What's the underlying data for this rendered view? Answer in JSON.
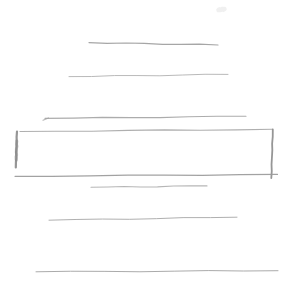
{
  "page": {
    "background": "#ffffff",
    "width": 296,
    "height": 286
  },
  "wireframe": {
    "text_lines": [
      {
        "name": "text-line-1",
        "x1": 89,
        "y1": 42.6,
        "x2": 218,
        "y2": 45,
        "color": "#9e9e9e",
        "width": 1.2
      },
      {
        "name": "text-line-2",
        "x1": 69,
        "y1": 76.6,
        "x2": 228,
        "y2": 74.4,
        "color": "#b3b3b3",
        "width": 1.0
      },
      {
        "name": "text-line-3",
        "x1": 45,
        "y1": 118.4,
        "x2": 246,
        "y2": 116.3,
        "color": "#a5a5a5",
        "width": 1.1,
        "tick": true
      },
      {
        "name": "text-line-4",
        "x1": 91,
        "y1": 187.3,
        "x2": 207,
        "y2": 185.9,
        "color": "#b0b0b0",
        "width": 1.1
      },
      {
        "name": "text-line-5",
        "x1": 49,
        "y1": 220.2,
        "x2": 237,
        "y2": 217.2,
        "color": "#a8a8a8",
        "width": 1.0
      },
      {
        "name": "text-line-6",
        "x1": 36,
        "y1": 271.8,
        "x2": 278,
        "y2": 270.7,
        "color": "#a3a3a3",
        "width": 1.0
      }
    ],
    "box": {
      "name": "input-box",
      "edges": [
        {
          "name": "box-top-edge",
          "x1": 20,
          "y1": 131.5,
          "x2": 272.5,
          "y2": 129.3,
          "color": "#a8a8a8",
          "width": 1.1
        },
        {
          "name": "box-right-edge",
          "x1": 272.8,
          "y1": 129.5,
          "x2": 271.3,
          "y2": 178,
          "color": "#8d8d8d",
          "width": 1.8
        },
        {
          "name": "box-bottom-edge",
          "x1": 15,
          "y1": 176.3,
          "x2": 277.5,
          "y2": 174.4,
          "color": "#9a9a9a",
          "width": 1.2
        },
        {
          "name": "box-left-edge",
          "x1": 17,
          "y1": 131.5,
          "x2": 15.8,
          "y2": 167.5,
          "color": "#8d8d8d",
          "width": 2.2
        },
        {
          "name": "box-left-edge-overdraw",
          "x1": 16.8,
          "y1": 141,
          "x2": 16.2,
          "y2": 160,
          "color": "#888888",
          "width": 3.0,
          "opacity": 0.55
        }
      ]
    },
    "smudge": {
      "name": "faint-smudge",
      "x1": 218.5,
      "y1": 10,
      "x2": 224.5,
      "y2": 9,
      "color": "#e9e9e9",
      "width": 4.5,
      "opacity": 0.7
    }
  }
}
